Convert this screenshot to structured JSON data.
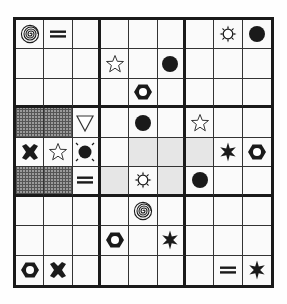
{
  "puzzle": {
    "type": "symbol-sudoku",
    "size": 9,
    "box_size": 3,
    "colors": {
      "ink": "#1a1a1a",
      "light_shade": "#e6e6e6",
      "hatch_shade": "#9a9a9a",
      "paper": "#fafafa"
    },
    "symbol_legend": {
      "spiral": "spiral-icon",
      "equals": "equals-icon",
      "sun": "sun-icon",
      "dot": "filled-circle-icon",
      "star": "outline-star-icon",
      "hex": "hex-nut-icon",
      "triangle": "down-triangle-icon",
      "cross": "bold-x-icon",
      "burst": "six-point-star-icon",
      "dot-rays": "circle-with-rays-icon"
    },
    "grid": [
      [
        "spiral",
        "equals",
        "",
        "",
        "",
        "",
        "",
        "sun",
        "dot"
      ],
      [
        "",
        "",
        "",
        "star",
        "",
        "dot",
        "",
        "",
        ""
      ],
      [
        "",
        "",
        "",
        "",
        "hex",
        "",
        "",
        "",
        ""
      ],
      [
        "",
        "",
        "triangle",
        "",
        "dot",
        "",
        "star",
        "",
        ""
      ],
      [
        "cross",
        "star",
        "dot-rays",
        "",
        "",
        "",
        "",
        "burst",
        "hex"
      ],
      [
        "",
        "",
        "equals",
        "",
        "sun",
        "",
        "dot",
        "",
        ""
      ],
      [
        "",
        "",
        "",
        "",
        "spiral",
        "",
        "",
        "",
        ""
      ],
      [
        "",
        "",
        "",
        "hex",
        "",
        "burst",
        "",
        "",
        ""
      ],
      [
        "hex",
        "cross",
        "",
        "",
        "",
        "",
        "",
        "equals",
        "burst"
      ]
    ],
    "shading": [
      [
        "",
        "",
        "",
        "",
        "",
        "",
        "",
        "",
        ""
      ],
      [
        "",
        "",
        "",
        "",
        "",
        "",
        "",
        "",
        ""
      ],
      [
        "",
        "",
        "",
        "",
        "",
        "",
        "",
        "",
        ""
      ],
      [
        "hatch",
        "hatch",
        "",
        "",
        "",
        "",
        "",
        "",
        ""
      ],
      [
        "",
        "",
        "",
        "",
        "light",
        "light",
        "light",
        "",
        ""
      ],
      [
        "hatch",
        "hatch",
        "",
        "light",
        "",
        "light",
        "",
        "",
        ""
      ],
      [
        "",
        "",
        "",
        "",
        "",
        "",
        "",
        "",
        ""
      ],
      [
        "",
        "",
        "",
        "",
        "",
        "",
        "",
        "",
        ""
      ],
      [
        "",
        "",
        "",
        "",
        "",
        "",
        "",
        "",
        ""
      ]
    ]
  }
}
